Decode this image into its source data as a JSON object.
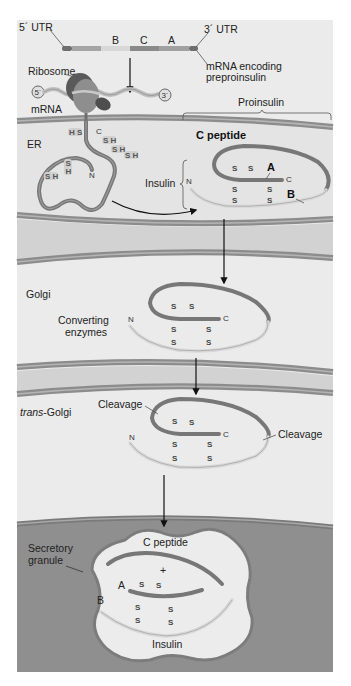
{
  "colors": {
    "page_bg": "#ffffff",
    "panel_light": "#ebebeb",
    "panel_band": "#d2d2d2",
    "membrane": "#8c8c8c",
    "membrane_inner": "#b4b4b4",
    "granule_region": "#8f8f8f",
    "granule_fill": "#ececec",
    "chain_dark": "#777777",
    "chain_light": "#d9d9d9",
    "ribosome_dark": "#5a5a5a",
    "ribosome_mid": "#8e8e8e",
    "text": "#222222"
  },
  "mrna": {
    "utr5_label": "5´ UTR",
    "utr3_label": "3´ UTR",
    "segments": [
      "B",
      "C",
      "A"
    ],
    "caption_line1": "mRNA encoding",
    "caption_line2": "preproinsulin"
  },
  "translation": {
    "ribosome_label": "Ribosome",
    "mrna_label": "mRNA",
    "end5": "5´",
    "end3": "3´"
  },
  "er": {
    "label": "ER",
    "sh_groups": [
      "H S",
      "S H",
      "S H",
      "S H",
      "S H",
      "S H"
    ],
    "nascent_n": "N",
    "nascent_c": "C",
    "proinsulin_label": "Proinsulin",
    "c_peptide_label": "C peptide",
    "insulin_label": "Insulin",
    "chain_a_label": "A",
    "chain_b_label": "B",
    "n_label": "N",
    "c_label": "C",
    "disulfide": "S"
  },
  "golgi": {
    "label": "Golgi",
    "enzymes_line1": "Converting",
    "enzymes_line2": "enzymes",
    "n_label": "N",
    "c_label": "C",
    "disulfide": "S"
  },
  "trans_golgi": {
    "label_italic": "trans",
    "label_rest": "-Golgi",
    "cleavage_left": "Cleavage",
    "cleavage_right": "Cleavage",
    "n_label": "N",
    "c_label": "C",
    "disulfide": "S"
  },
  "granule": {
    "label_line1": "Secretory",
    "label_line2": "granule",
    "c_peptide_label": "C peptide",
    "plus": "+",
    "chain_a_label": "A",
    "chain_b_label": "B",
    "insulin_label": "Insulin",
    "disulfide": "S"
  }
}
